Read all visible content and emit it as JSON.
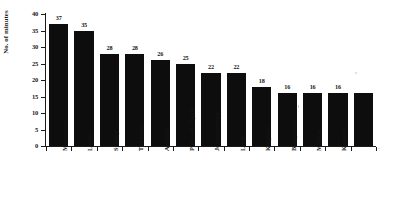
{
  "chart_data": {
    "type": "bar",
    "title": "",
    "subtitle": "",
    "xlabel": "",
    "ylabel": "No. of minutes",
    "ylim": [
      0,
      40
    ],
    "grid": false,
    "legend": false,
    "y_ticks": [
      0,
      5,
      10,
      15,
      20,
      25,
      30,
      35,
      40
    ],
    "categories": [
      "Melbourne",
      "Lord's",
      "Sydney",
      "The Oval",
      "Adelaide",
      "Port - of - Spain",
      "Johannesburg",
      "Leeds",
      "Kingston",
      "Bridgetown",
      "Madras",
      "Karachi"
    ],
    "values": [
      37,
      35,
      28,
      28,
      26,
      25,
      22,
      22,
      18,
      16,
      16,
      16
    ],
    "value_labels": [
      "37",
      "35",
      "28",
      "28",
      "26",
      "25",
      "22",
      "22",
      "18",
      "16",
      "16",
      "16"
    ],
    "bar_color": "#0d0d0d",
    "axis_color": "#1a1a1a",
    "background_color": "#ffffff"
  }
}
